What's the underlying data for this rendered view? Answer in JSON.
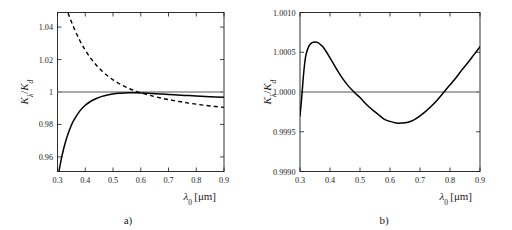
{
  "figure": {
    "background": "#ffffff",
    "curve_color": "#000000",
    "reference_line_color": "#8c8c8c",
    "axis_color": "#1a1a1a"
  },
  "panels": [
    {
      "caption": "a)",
      "chart_data": {
        "type": "line",
        "title": "",
        "xlabel": "λ₀ [μm]",
        "ylabel": "Kλ/Kd",
        "ylabel_parts": {
          "main": "K",
          "sub1": "λ",
          "divider": "/",
          "main2": "K",
          "sub2": "d"
        },
        "xlim": [
          0.3,
          0.9
        ],
        "ylim": [
          0.951,
          1.049
        ],
        "xticks": [
          0.3,
          0.4,
          0.5,
          0.6,
          0.7,
          0.8,
          0.9
        ],
        "xticklabels": [
          "0.3",
          "0.4",
          "0.5",
          "0.6",
          "0.7",
          "0.8",
          "0.9"
        ],
        "yticks": [
          0.96,
          0.98,
          1.0,
          1.02,
          1.04
        ],
        "yticklabels": [
          "0.96",
          "0.98",
          "1",
          "1.02",
          "1.04"
        ],
        "grid": false,
        "legend": "none",
        "reference_line_y": 1.0,
        "series": [
          {
            "name": "solid-curve",
            "style": "solid",
            "x": [
              0.3,
              0.31,
              0.32,
              0.33,
              0.34,
              0.35,
              0.36,
              0.38,
              0.4,
              0.42,
              0.44,
              0.46,
              0.48,
              0.5,
              0.52,
              0.54,
              0.56,
              0.58,
              0.6,
              0.64,
              0.68,
              0.72,
              0.76,
              0.8,
              0.85,
              0.9
            ],
            "values": [
              0.946,
              0.9555,
              0.9635,
              0.97,
              0.9752,
              0.9795,
              0.983,
              0.9882,
              0.9918,
              0.9943,
              0.996,
              0.9973,
              0.9982,
              0.9988,
              0.9992,
              0.9994,
              0.9995,
              0.9995,
              0.9994,
              0.9991,
              0.9987,
              0.9983,
              0.9979,
              0.9975,
              0.9971,
              0.9967
            ]
          },
          {
            "name": "dashed-curve",
            "style": "dashed",
            "x": [
              0.3,
              0.32,
              0.34,
              0.36,
              0.38,
              0.4,
              0.42,
              0.44,
              0.46,
              0.48,
              0.5,
              0.52,
              0.54,
              0.56,
              0.58,
              0.6,
              0.64,
              0.68,
              0.72,
              0.76,
              0.8,
              0.85,
              0.9
            ],
            "values": [
              1.07,
              1.058,
              1.0478,
              1.0392,
              1.0319,
              1.0258,
              1.0207,
              1.0165,
              1.013,
              1.01,
              1.0075,
              1.0054,
              1.0036,
              1.002,
              1.0007,
              0.9995,
              0.9976,
              0.996,
              0.9947,
              0.9935,
              0.9925,
              0.9914,
              0.9905
            ]
          }
        ]
      }
    },
    {
      "caption": "b)",
      "chart_data": {
        "type": "line",
        "title": "",
        "xlabel": "λ₀ [μm]",
        "ylabel": "Kλ/Kd",
        "ylabel_parts": {
          "main": "K",
          "sub1": "λ",
          "divider": "/",
          "main2": "K",
          "sub2": "d"
        },
        "xlim": [
          0.3,
          0.9
        ],
        "ylim": [
          0.999,
          1.001
        ],
        "xticks": [
          0.3,
          0.4,
          0.5,
          0.6,
          0.7,
          0.8,
          0.9
        ],
        "xticklabels": [
          "0.3",
          "0.4",
          "0.5",
          "0.6",
          "0.7",
          "0.8",
          "0.9"
        ],
        "yticks": [
          0.999,
          0.9995,
          1.0,
          1.0005,
          1.001
        ],
        "yticklabels": [
          "0.9990",
          "0.9995",
          "1.0000",
          "1.0005",
          "1.0010"
        ],
        "grid": false,
        "legend": "none",
        "reference_line_y": 1.0,
        "series": [
          {
            "name": "solid-curve",
            "style": "solid",
            "x": [
              0.3,
              0.305,
              0.31,
              0.315,
              0.32,
              0.33,
              0.34,
              0.35,
              0.36,
              0.37,
              0.38,
              0.4,
              0.42,
              0.44,
              0.46,
              0.48,
              0.5,
              0.52,
              0.54,
              0.56,
              0.58,
              0.6,
              0.62,
              0.64,
              0.66,
              0.68,
              0.7,
              0.72,
              0.74,
              0.76,
              0.78,
              0.8,
              0.82,
              0.84,
              0.86,
              0.88,
              0.9
            ],
            "values": [
              0.9997,
              0.9999,
              1.00014,
              1.00034,
              1.00047,
              1.00058,
              1.00062,
              1.00063,
              1.00062,
              1.00059,
              1.00055,
              1.00043,
              1.0003,
              1.00018,
              1.00008,
              1.0,
              0.99993,
              0.99985,
              0.99978,
              0.99972,
              0.99966,
              0.99963,
              0.99961,
              0.99961,
              0.99962,
              0.99965,
              0.9997,
              0.99976,
              0.99983,
              0.99991,
              1.0,
              1.00009,
              1.00018,
              1.00028,
              1.00037,
              1.00047,
              1.00057
            ]
          }
        ]
      }
    }
  ]
}
